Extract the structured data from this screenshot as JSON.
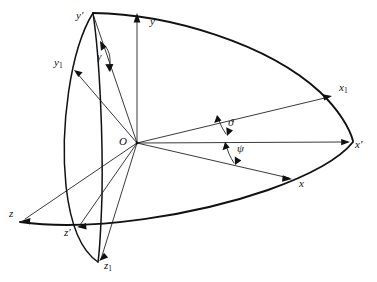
{
  "figure": {
    "kind": "euler-angle-axes-diagram",
    "background_color": "#ffffff",
    "line_color": "#111111",
    "width": 377,
    "height": 282
  },
  "origin": {
    "label": "O",
    "x": 137,
    "y": 143
  },
  "axis_labels": [
    {
      "id": "y-prime",
      "base": "y",
      "prime": "′",
      "sub": "",
      "x": 78,
      "y": 17,
      "tip_x": 93,
      "tip_y": 14
    },
    {
      "id": "y",
      "base": "y",
      "prime": "",
      "sub": "",
      "x": 152,
      "y": 23,
      "tip_x": 137,
      "tip_y": 14
    },
    {
      "id": "y-one",
      "base": "y",
      "prime": "",
      "sub": "1",
      "x": 56,
      "y": 64,
      "tip_x": 74,
      "tip_y": 70
    },
    {
      "id": "x-one",
      "base": "x",
      "prime": "",
      "sub": "1",
      "x": 342,
      "y": 89,
      "tip_x": 332,
      "tip_y": 96
    },
    {
      "id": "x-prime",
      "base": "x",
      "prime": "′",
      "sub": "",
      "x": 357,
      "y": 146,
      "tip_x": 350,
      "tip_y": 142
    },
    {
      "id": "x",
      "base": "x",
      "prime": "",
      "sub": "",
      "x": 301,
      "y": 185,
      "tip_x": 292,
      "tip_y": 179
    },
    {
      "id": "z",
      "base": "z",
      "prime": "",
      "sub": "",
      "x": 11,
      "y": 214,
      "tip_x": 22,
      "tip_y": 220
    },
    {
      "id": "z-prime",
      "base": "z",
      "prime": "′",
      "sub": "",
      "x": 66,
      "y": 234,
      "tip_x": 78,
      "tip_y": 227
    },
    {
      "id": "z-one",
      "base": "z",
      "prime": "",
      "sub": "1",
      "x": 106,
      "y": 267,
      "tip_x": 100,
      "tip_y": 261
    }
  ],
  "angle_labels": [
    {
      "id": "gamma",
      "glyph": "γ",
      "x": 99,
      "y": 58,
      "name": "gamma-angle-label"
    },
    {
      "id": "theta",
      "glyph": "ϑ",
      "x": 230,
      "y": 124,
      "name": "theta-angle-label"
    },
    {
      "id": "psi",
      "glyph": "ψ",
      "x": 239,
      "y": 150,
      "name": "psi-angle-label"
    }
  ],
  "rays": [
    {
      "id": "ray-to-y-prime",
      "to_x": 93,
      "to_y": 14,
      "arrow": false
    },
    {
      "id": "ray-to-y",
      "to_x": 137,
      "to_y": 14,
      "arrow": true
    },
    {
      "id": "ray-to-y-one",
      "to_x": 74,
      "to_y": 70,
      "arrow": true
    },
    {
      "id": "ray-to-x-one",
      "to_x": 332,
      "to_y": 96,
      "arrow": true
    },
    {
      "id": "ray-to-x-prime",
      "to_x": 350,
      "to_y": 142,
      "arrow": true
    },
    {
      "id": "ray-to-x",
      "to_x": 292,
      "to_y": 179,
      "arrow": true
    },
    {
      "id": "ray-to-z",
      "to_x": 22,
      "to_y": 220,
      "arrow": true
    },
    {
      "id": "ray-to-z-prime",
      "to_x": 78,
      "to_y": 227,
      "arrow": true
    },
    {
      "id": "ray-to-z-one",
      "to_x": 100,
      "to_y": 261,
      "arrow": true
    }
  ],
  "arcs": [
    {
      "id": "great-arc-upper",
      "from": "y-prime",
      "to": "x-prime",
      "via": "x-one"
    },
    {
      "id": "great-arc-lower",
      "from": "z",
      "to": "x-prime",
      "via": "x"
    },
    {
      "id": "lens-meridian",
      "from": "y-prime",
      "to": "z-one",
      "via": "z-prime"
    }
  ]
}
